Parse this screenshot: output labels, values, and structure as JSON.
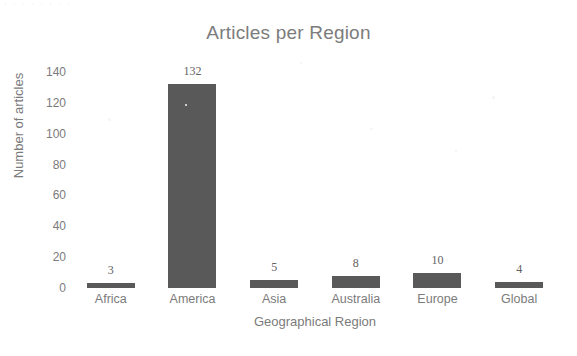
{
  "page": {
    "background_color": "#ffffff",
    "scan_artifact_topline": "·  ·   ·  ·        ·        ·            ·        ·"
  },
  "chart_data": {
    "type": "bar",
    "title": "Articles per Region",
    "xlabel": "Geographical Region",
    "ylabel": "Number of articles",
    "categories": [
      "Africa",
      "America",
      "Asia",
      "Australia",
      "Europe",
      "Global"
    ],
    "values": [
      3,
      132,
      5,
      8,
      10,
      4
    ],
    "value_labels": [
      "3",
      "132",
      "5",
      "8",
      "10",
      "4"
    ],
    "ylim": [
      0,
      140
    ],
    "yticks": [
      0,
      20,
      40,
      60,
      80,
      100,
      120,
      140
    ],
    "ytick_labels": [
      "0",
      "20",
      "40",
      "60",
      "80",
      "100",
      "120",
      "140"
    ],
    "grid": false,
    "legend": null,
    "bar_color": "#595959",
    "text_color": "#7b7b7b",
    "title_color": "#7c7c7c"
  }
}
